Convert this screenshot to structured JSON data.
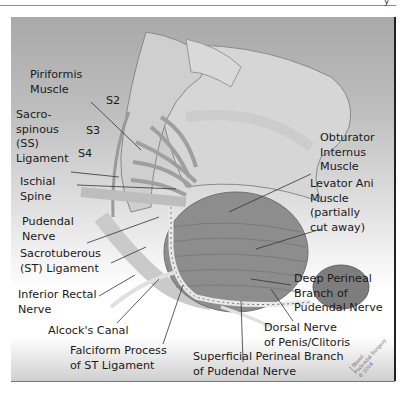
{
  "header": {
    "corner_glyph": "y"
  },
  "diagram": {
    "title": "",
    "labels": {
      "piriformis": "Piriformis\nMuscle",
      "s2": "S2",
      "s3": "S3",
      "s4": "S4",
      "sacrospinous": "Sacro-\nspinous\n(SS)\nLigament",
      "ischial_spine": "Ischial\nSpine",
      "pudendal_nerve": "Pudendal\nNerve",
      "sacrotuberous": "Sacrotuberous\n(ST) Ligament",
      "inferior_rectal": "Inferior Rectal\nNerve",
      "alcocks_canal": "Alcock's Canal",
      "falciform": "Falciform Process\nof ST Ligament",
      "obturator": "Obturator\nInternus\nMuscle",
      "levator_ani": "Levator Ani\nMuscle\n(partially\ncut away)",
      "deep_perineal": "Deep Perineal\nBranch of\nPudendal Nerve",
      "dorsal_nerve": "Dorsal Nerve\nof Penis/Clitoris",
      "superficial_perineal": "Superficial Perineal Branch\nof Pudendal Nerve"
    },
    "signature": "J Bland\nPudendal Surgery\n© 2004"
  },
  "colors": {
    "background_top": "#a9a9a9",
    "bone": "#d9d9d9",
    "muscle": "#8c8c8c",
    "nerve": "#e6e6e6",
    "text": "#1a1a1a"
  }
}
